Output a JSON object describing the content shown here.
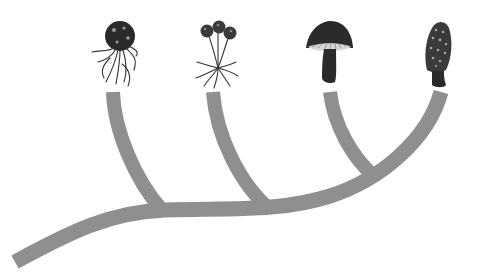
{
  "diagram": {
    "type": "phylogenetic-tree",
    "branch_color": "#8f8f8f",
    "branch_width": 15,
    "trunk": {
      "from": [
        15,
        262
      ],
      "to": [
        440,
        92
      ]
    },
    "tips": [
      {
        "icon": "spore-ball-with-hyphae-icon",
        "x": 113,
        "y": 92
      },
      {
        "icon": "triple-sporangia-stalk-icon",
        "x": 213,
        "y": 92
      },
      {
        "icon": "gilled-mushroom-icon",
        "x": 330,
        "y": 92
      },
      {
        "icon": "morel-mushroom-icon",
        "x": 440,
        "y": 92
      }
    ],
    "nodes": [
      {
        "x": 160,
        "y": 210
      },
      {
        "x": 270,
        "y": 210
      },
      {
        "x": 375,
        "y": 176
      }
    ]
  }
}
